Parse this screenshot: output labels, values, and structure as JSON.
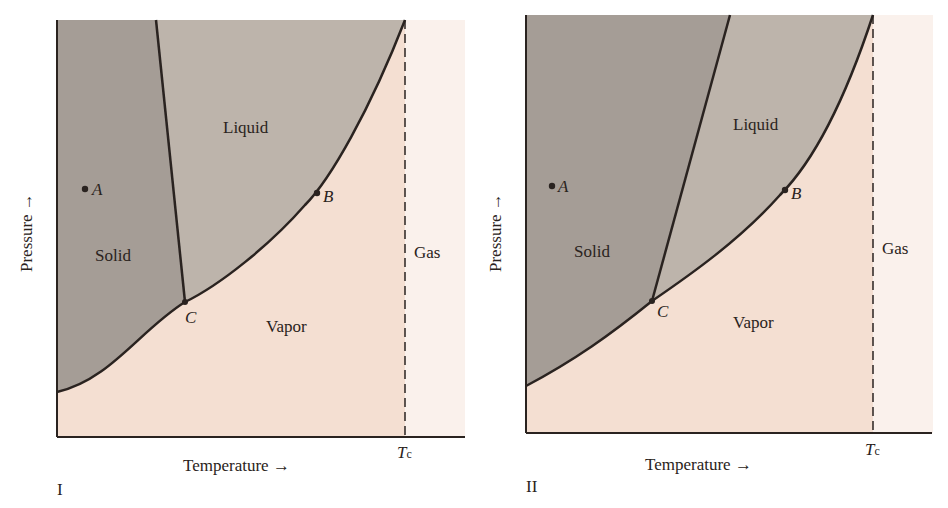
{
  "colors": {
    "solid": "#a59d96",
    "liquid": "#bdb4ab",
    "vapor": "#f4dfd2",
    "gas": "#faf1ec",
    "line": "#2a2320"
  },
  "panels": [
    {
      "id": "I",
      "caption": "I",
      "xlabel": "Temperature →",
      "ylabel": "Pressure →",
      "tc_label": "T",
      "tc_sub": "c",
      "regions": {
        "solid": "Solid",
        "liquid": "Liquid",
        "vapor": "Vapor",
        "gas": "Gas"
      },
      "points": {
        "A": "A",
        "B": "B",
        "C": "C"
      },
      "note": "Solid-liquid line slopes backward (negative slope)"
    },
    {
      "id": "II",
      "caption": "II",
      "xlabel": "Temperature →",
      "ylabel": "Pressure →",
      "tc_label": "T",
      "tc_sub": "c",
      "regions": {
        "solid": "Solid",
        "liquid": "Liquid",
        "vapor": "Vapor",
        "gas": "Gas"
      },
      "points": {
        "A": "A",
        "B": "B",
        "C": "C"
      },
      "note": "Solid-liquid line slopes forward (positive slope)"
    }
  ]
}
